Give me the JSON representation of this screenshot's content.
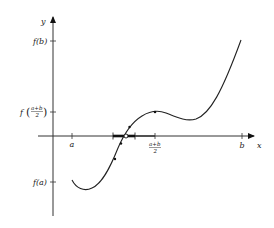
{
  "diagram": {
    "axes": {
      "x_label": "x",
      "y_label": "y"
    },
    "x_ticks": [
      {
        "label": "a",
        "x": 72
      },
      {
        "label_num": "a+b",
        "label_den": "2",
        "x": 155
      },
      {
        "label": "b",
        "x": 242
      }
    ],
    "y_ticks": [
      {
        "label": "f(b)",
        "y": 41
      },
      {
        "label_prefix": "f",
        "label_num": "a+b",
        "label_den": "2",
        "y": 112
      },
      {
        "label": "f(a)",
        "y": 182
      }
    ],
    "curve": {
      "name": "f(x)",
      "color": "#222222"
    },
    "root_marker": {
      "type": "open-circle",
      "x": 126,
      "y": 136
    },
    "bracket": {
      "left": 113,
      "right": 135
    },
    "curve_points": [
      {
        "x": 155,
        "y": 112
      },
      {
        "x": 120,
        "y": 146
      },
      {
        "x": 116,
        "y": 161
      }
    ]
  }
}
